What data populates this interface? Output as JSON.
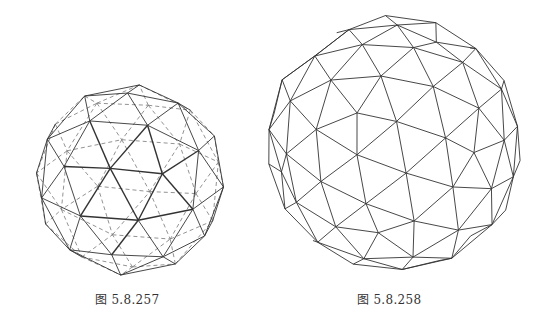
{
  "figures": [
    {
      "id": "fig1",
      "caption": "图 5.8.257",
      "description": "Geodesic sphere wireframe with hidden edges dashed",
      "frequency": 2,
      "show_hidden_dashed": true,
      "rotation": {
        "x": -0.55,
        "y": 0.35,
        "z": 0.2
      },
      "stroke_color": "#333333",
      "hidden_stroke_color": "#777777"
    },
    {
      "id": "fig2",
      "caption": "图 5.8.258",
      "description": "Geodesic sphere wireframe, visible edges only, with pentagonal dimples",
      "frequency": 3,
      "show_hidden_dashed": false,
      "rotation": {
        "x": 0.25,
        "y": -0.3,
        "z": 0.1
      },
      "stroke_color": "#333333",
      "hidden_stroke_color": "#777777"
    }
  ]
}
